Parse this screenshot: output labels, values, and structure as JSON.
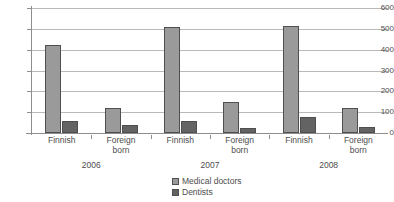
{
  "chart_data": {
    "type": "bar",
    "title": "",
    "subtitle": "",
    "xlabel": "",
    "ylabel": "",
    "ylim": [
      0,
      600
    ],
    "ytick_labels": [
      "600",
      "500",
      "400",
      "300",
      "200",
      "100",
      "0"
    ],
    "ytick_values": [
      600,
      500,
      400,
      300,
      200,
      100,
      0
    ],
    "grid": true,
    "legend_position": "bottom-center",
    "groups": [
      {
        "year": "2006",
        "categories": [
          {
            "label_line1": "Finnish",
            "label_line2": ""
          },
          {
            "label_line1": "Foreign",
            "label_line2": "born"
          }
        ]
      },
      {
        "year": "2007",
        "categories": [
          {
            "label_line1": "Finnish",
            "label_line2": ""
          },
          {
            "label_line1": "Foreign",
            "label_line2": "born"
          }
        ]
      },
      {
        "year": "2008",
        "categories": [
          {
            "label_line1": "Finnish",
            "label_line2": ""
          },
          {
            "label_line1": "Foreign",
            "label_line2": "born"
          }
        ]
      }
    ],
    "categories": [
      "2006 Finnish",
      "2006 Foreign born",
      "2007 Finnish",
      "2007 Foreign born",
      "2008 Finnish",
      "2008 Foreign born"
    ],
    "series": [
      {
        "name": "Medical doctors",
        "color": "#9a9a9a",
        "values": [
          422,
          118,
          510,
          148,
          512,
          122
        ]
      },
      {
        "name": "Dentists",
        "color": "#636363",
        "values": [
          58,
          38,
          56,
          24,
          78,
          28
        ]
      }
    ],
    "legend": [
      {
        "label": "Medical doctors",
        "color": "#9a9a9a"
      },
      {
        "label": "Dentists",
        "color": "#636363"
      }
    ]
  }
}
